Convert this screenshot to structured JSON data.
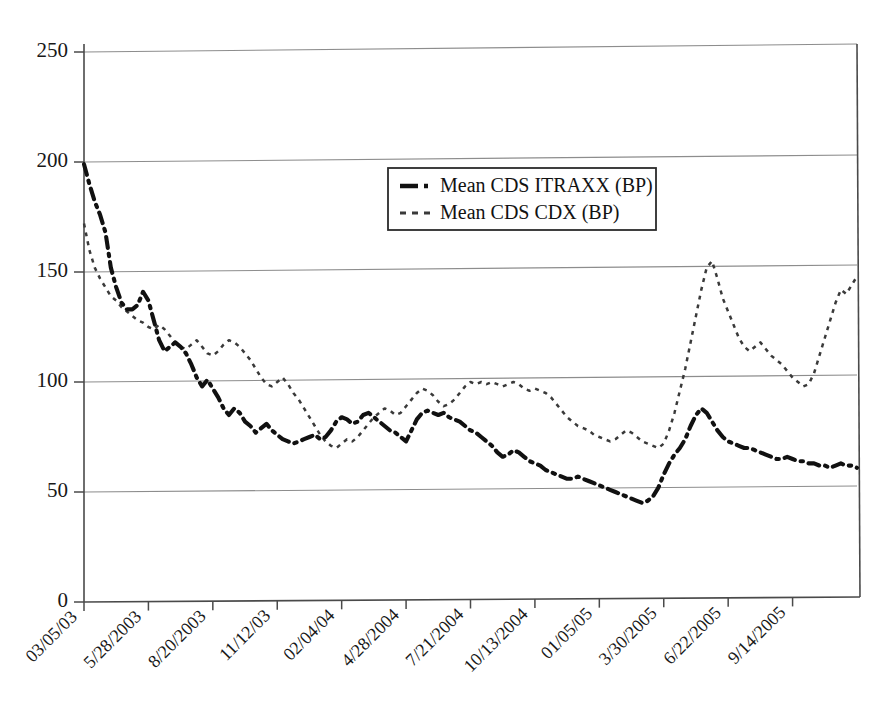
{
  "chart_data": {
    "type": "line",
    "title": "",
    "xlabel": "",
    "ylabel": "",
    "ylim": [
      0,
      250
    ],
    "yticks": [
      0,
      50,
      100,
      150,
      200,
      250
    ],
    "grid": true,
    "legend_position": "upper-center",
    "xtick_labels": [
      "03/05/03",
      "5/28/2003",
      "8/20/2003",
      "11/12/03",
      "02/04/04",
      "4/28/2004",
      "7/21/2004",
      "10/13/2004",
      "01/05/05",
      "3/30/2005",
      "6/22/2005",
      "9/14/2005"
    ],
    "series": [
      {
        "name": "Mean CDS ITRAXX (BP)",
        "style": "dash-dot-thick",
        "color": "#111111",
        "values": [
          199,
          190,
          182,
          176,
          168,
          152,
          143,
          136,
          133,
          133,
          135,
          141,
          137,
          128,
          119,
          114,
          116,
          118,
          116,
          113,
          108,
          102,
          98,
          101,
          97,
          93,
          88,
          85,
          88,
          86,
          82,
          80,
          77,
          79,
          81,
          78,
          76,
          74,
          73,
          72,
          73,
          74,
          75,
          76,
          74,
          75,
          78,
          82,
          84,
          83,
          81,
          82,
          85,
          86,
          84,
          82,
          80,
          78,
          77,
          75,
          73,
          78,
          83,
          86,
          87,
          86,
          85,
          86,
          84,
          83,
          82,
          80,
          78,
          77,
          75,
          73,
          71,
          68,
          66,
          67,
          69,
          68,
          66,
          64,
          63,
          62,
          60,
          59,
          58,
          57,
          56,
          56,
          57,
          56,
          55,
          54,
          53,
          52,
          51,
          50,
          49,
          48,
          47,
          46,
          45,
          46,
          48,
          52,
          58,
          63,
          67,
          70,
          74,
          80,
          85,
          88,
          86,
          82,
          78,
          75,
          73,
          72,
          71,
          70,
          70,
          69,
          68,
          67,
          66,
          65,
          65,
          66,
          65,
          64,
          64,
          63,
          63,
          62,
          62,
          61,
          62,
          63,
          62,
          62,
          61
        ]
      },
      {
        "name": "Mean CDS  CDX (BP)",
        "style": "dotted-thin",
        "color": "#3a3a3a",
        "values": [
          172,
          160,
          152,
          147,
          143,
          139,
          137,
          134,
          132,
          130,
          128,
          127,
          125,
          124,
          126,
          124,
          121,
          118,
          116,
          115,
          117,
          119,
          116,
          113,
          112,
          114,
          117,
          119,
          118,
          116,
          113,
          110,
          106,
          102,
          99,
          98,
          100,
          102,
          99,
          95,
          92,
          88,
          84,
          80,
          76,
          73,
          71,
          70,
          72,
          74,
          73,
          75,
          78,
          81,
          84,
          86,
          88,
          87,
          85,
          86,
          89,
          92,
          95,
          97,
          96,
          94,
          91,
          89,
          90,
          92,
          95,
          98,
          100,
          99,
          100,
          99,
          100,
          99,
          98,
          99,
          100,
          99,
          97,
          96,
          97,
          96,
          95,
          93,
          90,
          87,
          84,
          82,
          80,
          79,
          78,
          76,
          75,
          74,
          73,
          74,
          76,
          78,
          77,
          75,
          73,
          72,
          71,
          70,
          72,
          78,
          86,
          96,
          106,
          118,
          130,
          142,
          152,
          155,
          147,
          138,
          132,
          126,
          120,
          116,
          114,
          116,
          118,
          115,
          112,
          110,
          108,
          105,
          102,
          100,
          98,
          99,
          104,
          112,
          120,
          128,
          136,
          142,
          140,
          144,
          148
        ]
      }
    ]
  },
  "legend": {
    "items": [
      {
        "label": "Mean CDS ITRAXX (BP)"
      },
      {
        "label": "Mean CDS  CDX (BP)"
      }
    ]
  },
  "axes": {
    "y_labels": [
      "250",
      "200",
      "150",
      "100",
      "50",
      "0"
    ],
    "x_labels": [
      "03/05/03",
      "5/28/2003",
      "8/20/2003",
      "11/12/03",
      "02/04/04",
      "4/28/2004",
      "7/21/2004",
      "10/13/2004",
      "01/05/05",
      "3/30/2005",
      "6/22/2005",
      "9/14/2005"
    ]
  }
}
